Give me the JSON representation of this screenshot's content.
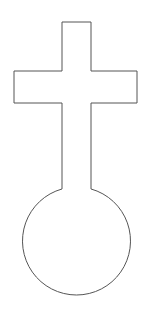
{
  "figure": {
    "background": "#ffffff",
    "stroke": "#555555",
    "stroke_width": 1,
    "shape": {
      "cross": {
        "top_y": 22,
        "stem_left_x": 62,
        "stem_right_x": 91,
        "arm_top_y": 71,
        "arm_bottom_y": 103,
        "arm_left_x": 14,
        "arm_right_x": 137,
        "stem_bottom_y": 188
      },
      "circle": {
        "cx": 76.5,
        "cy": 241,
        "r": 54
      }
    }
  }
}
